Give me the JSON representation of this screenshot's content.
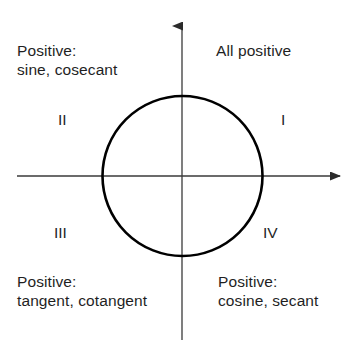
{
  "diagram": {
    "colors": {
      "background": "#ffffff",
      "axis": "#3a3a3a",
      "circle": "#000000",
      "text": "#1f1f1f"
    },
    "geometry": {
      "origin_x": 182,
      "origin_y": 176,
      "circle_radius": 80,
      "circle_stroke_width": 2.6,
      "axis_stroke_width": 1.3,
      "x_axis_start_x": 17,
      "x_axis_end_x": 349,
      "y_axis_top_y": 17,
      "y_axis_bottom_y": 340
    },
    "quadrants": [
      {
        "id": "I",
        "numeral": "I",
        "note_lines": [
          "All positive"
        ],
        "positive_functions": [
          "sine",
          "cosecant",
          "tangent",
          "cotangent",
          "cosine",
          "secant"
        ]
      },
      {
        "id": "II",
        "numeral": "II",
        "note_lines": [
          "Positive:",
          "sine, cosecant"
        ],
        "positive_functions": [
          "sine",
          "cosecant"
        ]
      },
      {
        "id": "III",
        "numeral": "III",
        "note_lines": [
          "Positive:",
          "tangent, cotangent"
        ],
        "positive_functions": [
          "tangent",
          "cotangent"
        ]
      },
      {
        "id": "IV",
        "numeral": "IV",
        "note_lines": [
          "Positive:",
          "cosine, secant"
        ],
        "positive_functions": [
          "cosine",
          "secant"
        ]
      }
    ]
  }
}
